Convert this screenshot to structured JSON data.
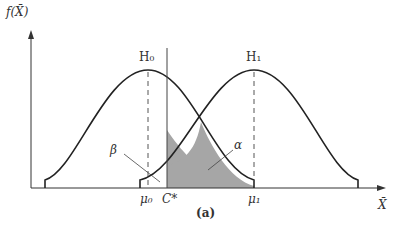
{
  "figure": {
    "y_axis_label": "f(X̄)",
    "x_axis_label": "X̄",
    "caption": "(a)",
    "h0_label": "H₀",
    "h1_label": "H₁",
    "mu0_label": "μ₀",
    "mu1_label": "μ₁",
    "critical_label": "C*",
    "beta_label": "β",
    "alpha_label": "α"
  },
  "colors": {
    "curve": "#222222",
    "shaded_region": "#a6a6a6",
    "axis": "#333333"
  }
}
